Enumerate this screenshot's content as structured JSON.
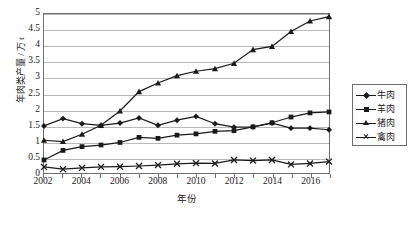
{
  "chart_data": {
    "type": "line",
    "title": "",
    "xlabel": "年份",
    "ylabel": "年肉类产量 / 万 t",
    "ylim": [
      0,
      5
    ],
    "ytick_values": [
      0,
      0.5,
      1,
      1.5,
      2,
      2.5,
      3,
      3.5,
      4,
      4.5,
      5
    ],
    "ytick_labels": [
      "0",
      "0.5",
      "1",
      "1.5",
      "2",
      "2.5",
      "3",
      "3.5",
      "4",
      "4.5",
      "5"
    ],
    "xlim": [
      2002,
      2017
    ],
    "x": [
      2002,
      2003,
      2004,
      2005,
      2006,
      2007,
      2008,
      2009,
      2010,
      2011,
      2012,
      2013,
      2014,
      2015,
      2016,
      2017
    ],
    "xtick_labels": [
      "2002",
      "2004",
      "2006",
      "2008",
      "2010",
      "2012",
      "2014",
      "2016"
    ],
    "xtick_values": [
      2002,
      2004,
      2006,
      2008,
      2010,
      2012,
      2014,
      2016
    ],
    "grid": "horizontal",
    "legend_position": "right",
    "series": [
      {
        "name": "牛肉",
        "marker": "diamond",
        "values": [
          1.48,
          1.71,
          1.55,
          1.5,
          1.57,
          1.73,
          1.5,
          1.66,
          1.78,
          1.55,
          1.44,
          1.45,
          1.57,
          1.41,
          1.41,
          1.36
        ]
      },
      {
        "name": "羊肉",
        "marker": "square",
        "values": [
          0.41,
          0.71,
          0.83,
          0.88,
          0.96,
          1.12,
          1.09,
          1.19,
          1.23,
          1.31,
          1.33,
          1.45,
          1.58,
          1.76,
          1.89,
          1.92
        ]
      },
      {
        "name": "猪肉",
        "marker": "triangle",
        "values": [
          1.03,
          0.99,
          1.22,
          1.5,
          1.95,
          2.56,
          2.83,
          3.06,
          3.2,
          3.28,
          3.45,
          3.88,
          3.98,
          4.45,
          4.78,
          4.92
        ]
      },
      {
        "name": "禽肉",
        "marker": "cross",
        "values": [
          0.19,
          0.12,
          0.16,
          0.19,
          0.2,
          0.22,
          0.25,
          0.29,
          0.31,
          0.3,
          0.41,
          0.39,
          0.41,
          0.27,
          0.3,
          0.36
        ]
      }
    ]
  },
  "legend": {
    "items": [
      {
        "label": "牛肉",
        "marker": "diamond"
      },
      {
        "label": "羊肉",
        "marker": "square"
      },
      {
        "label": "猪肉",
        "marker": "triangle"
      },
      {
        "label": "禽肉",
        "marker": "cross"
      }
    ]
  },
  "axes": {
    "y_title": "年肉类产量 / 万 t",
    "x_title": "年份"
  },
  "colors": {
    "line": "#1a1a1a",
    "grid": "#b9b9b9",
    "frame": "#6e6e6e",
    "background": "#ffffff"
  }
}
